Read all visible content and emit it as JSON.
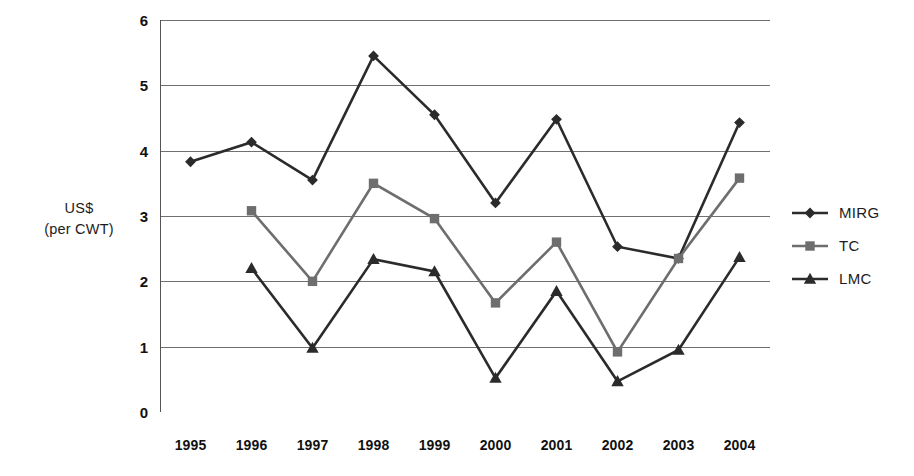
{
  "chart_data": {
    "type": "line",
    "title": "",
    "subtitle": "",
    "xlabel": "",
    "ylabel": "US$ (per CWT)",
    "ylabel_lines": [
      "US$",
      "(per CWT)"
    ],
    "categories": [
      "1995",
      "1996",
      "1997",
      "1998",
      "1999",
      "2000",
      "2001",
      "2002",
      "2003",
      "2004"
    ],
    "x": [
      1995,
      1996,
      1997,
      1998,
      1999,
      2000,
      2001,
      2002,
      2003,
      2004
    ],
    "ylim": [
      0,
      6
    ],
    "yticks": [
      0,
      1,
      2,
      3,
      4,
      5,
      6
    ],
    "ytick_labels": [
      "0",
      "1",
      "2",
      "3",
      "4",
      "5",
      "6"
    ],
    "grid": true,
    "grid_axis": "y",
    "legend_position": "right",
    "series": [
      {
        "name": "MIRG",
        "marker": "diamond",
        "color": "#2b2b2b",
        "values": [
          3.83,
          4.13,
          3.55,
          5.45,
          4.55,
          3.2,
          4.48,
          2.53,
          2.35,
          4.43
        ]
      },
      {
        "name": "TC",
        "marker": "square",
        "color": "#6e6e6e",
        "values": [
          null,
          3.08,
          2.0,
          3.5,
          2.96,
          1.67,
          2.6,
          0.92,
          2.35,
          3.58
        ]
      },
      {
        "name": "LMC",
        "marker": "triangle",
        "color": "#2b2b2b",
        "values": [
          null,
          2.2,
          0.98,
          2.34,
          2.15,
          0.52,
          1.85,
          0.47,
          0.95,
          2.37
        ]
      }
    ]
  },
  "legend": {
    "items": [
      {
        "label": "MIRG"
      },
      {
        "label": "TC"
      },
      {
        "label": "LMC"
      }
    ]
  },
  "colors": {
    "axis": "#555555",
    "grid": "#707070",
    "series_dark": "#2b2b2b",
    "series_gray": "#6e6e6e",
    "text": "#1c1c1c",
    "background": "#ffffff"
  }
}
